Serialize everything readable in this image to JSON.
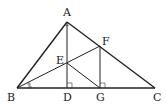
{
  "diagram": {
    "type": "geometry-figure",
    "points": {
      "A": {
        "label": "A",
        "x": 67,
        "y": 22
      },
      "B": {
        "label": "B",
        "x": 17,
        "y": 88
      },
      "C": {
        "label": "C",
        "x": 155,
        "y": 88
      },
      "D": {
        "label": "D",
        "x": 67,
        "y": 88
      },
      "E": {
        "label": "E",
        "x": 67,
        "y": 63
      },
      "F": {
        "label": "F",
        "x": 100,
        "y": 46
      },
      "G": {
        "label": "G",
        "x": 100,
        "y": 88
      }
    },
    "segments": [
      "AB",
      "AC",
      "BC",
      "AD",
      "BF",
      "FG",
      "EG"
    ],
    "right_angles": [
      "ADB",
      "FGC"
    ],
    "angle_marks": [
      {
        "vertex": "B",
        "type": "double-arc-equal",
        "description": "bisector marks at B"
      },
      {
        "vertex": "A",
        "type": "small-arc"
      }
    ],
    "colors": {
      "stroke": "#222222",
      "background": "#ffffff"
    }
  }
}
